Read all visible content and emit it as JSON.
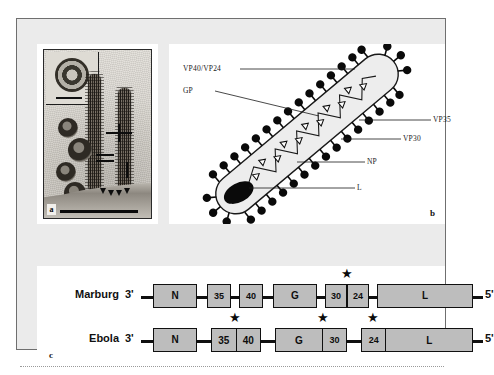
{
  "figure": {
    "panels": {
      "a": {
        "mark": "a",
        "caption_hidden": "",
        "type": "electron-micrograph"
      },
      "b": {
        "mark": "b",
        "labels": [
          {
            "id": "vp40-vp24",
            "text": "VP40/VP24"
          },
          {
            "id": "gp",
            "text": "GP"
          },
          {
            "id": "vp35",
            "text": "VP35"
          },
          {
            "id": "vp30",
            "text": "VP30"
          },
          {
            "id": "np",
            "text": "NP"
          },
          {
            "id": "l",
            "text": "L"
          }
        ]
      },
      "c": {
        "mark": "c",
        "rows": [
          {
            "name": "Marburg",
            "three_prime": "3'",
            "five_prime": "5'",
            "genes": [
              "N",
              "35",
              "40",
              "G",
              "30",
              "24",
              "L"
            ],
            "stars": [
              "30/24 junction"
            ]
          },
          {
            "name": "Ebola",
            "three_prime": "3'",
            "five_prime": "5'",
            "genes": [
              "N",
              "35",
              "40",
              "G",
              "30",
              "24",
              "L"
            ],
            "stars": [
              "35/40 junction",
              "G/30 junction",
              "24/L junction"
            ]
          }
        ]
      }
    },
    "colors": {
      "plate_background": "#ebebeb",
      "panel_background": "#ffffff",
      "gene_fill": "#bdbdbd",
      "outline": "#101010",
      "virion_fill": "#ededed",
      "spike_head": "#0a0a0a"
    },
    "glyphs": {
      "star": "★"
    }
  }
}
